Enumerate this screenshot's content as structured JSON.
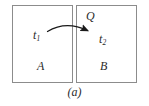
{
  "figure": {
    "caption": "(a)",
    "regions": [
      {
        "id": "A",
        "label": "A",
        "state_label": "t",
        "state_sub": "1"
      },
      {
        "id": "B",
        "label": "B",
        "state_label": "t",
        "state_sub": "2"
      }
    ],
    "transfer": {
      "label": "Q",
      "direction": "A-to-B",
      "arrow_style": "curved-arc-rightward"
    },
    "labels": {
      "t1_base": "t",
      "t1_sub": "1",
      "t2_base": "t",
      "t2_sub": "2",
      "q": "Q",
      "a": "A",
      "b": "B"
    },
    "colors": {
      "background": "#ffffff",
      "box_border": "#8c8c8c",
      "text": "#2b2b2b",
      "arrow": "#1a1a1a"
    }
  }
}
